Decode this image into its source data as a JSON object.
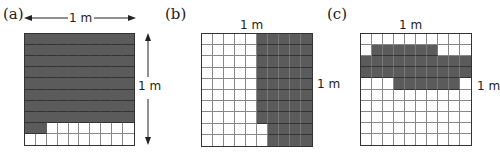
{
  "figure": {
    "colors": {
      "shaded": "#5b5b5b",
      "unshaded": "#ffffff",
      "grid_line": "#888888",
      "outline": "#333333"
    },
    "panels": [
      {
        "id": "a",
        "label": "(a)",
        "width_label": "1 m",
        "height_label": "1 m",
        "has_dimension_arrows": true,
        "grid_size": [
          10,
          10
        ],
        "shaded_count": 82,
        "shaded_rows": [
          [
            1,
            2,
            3,
            4,
            5,
            6,
            7,
            8,
            9,
            10
          ],
          [
            1,
            2,
            3,
            4,
            5,
            6,
            7,
            8,
            9,
            10
          ],
          [
            1,
            2,
            3,
            4,
            5,
            6,
            7,
            8,
            9,
            10
          ],
          [
            1,
            2,
            3,
            4,
            5,
            6,
            7,
            8,
            9,
            10
          ],
          [
            1,
            2,
            3,
            4,
            5,
            6,
            7,
            8,
            9,
            10
          ],
          [
            1,
            2,
            3,
            4,
            5,
            6,
            7,
            8,
            9,
            10
          ],
          [
            1,
            2,
            3,
            4,
            5,
            6,
            7,
            8,
            9,
            10
          ],
          [
            1,
            2,
            3,
            4,
            5,
            6,
            7,
            8,
            9,
            10
          ],
          [
            1,
            2
          ],
          []
        ]
      },
      {
        "id": "b",
        "label": "(b)",
        "width_label": "1 m",
        "height_label": "1 m",
        "has_dimension_arrows": false,
        "grid_size": [
          10,
          10
        ],
        "shaded_count": 48,
        "shaded_rows": [
          [
            6,
            7,
            8,
            9,
            10
          ],
          [
            6,
            7,
            8,
            9,
            10
          ],
          [
            6,
            7,
            8,
            9,
            10
          ],
          [
            6,
            7,
            8,
            9,
            10
          ],
          [
            6,
            7,
            8,
            9,
            10
          ],
          [
            6,
            7,
            8,
            9,
            10
          ],
          [
            6,
            7,
            8,
            9,
            10
          ],
          [
            6,
            7,
            8,
            9,
            10
          ],
          [
            7,
            8,
            9,
            10
          ],
          [
            7,
            8,
            9,
            10
          ]
        ]
      },
      {
        "id": "c",
        "label": "(c)",
        "width_label": "1 m",
        "height_label": "1 m",
        "has_dimension_arrows": false,
        "grid_size": [
          10,
          10
        ],
        "shaded_count": 32,
        "shaded_rows": [
          [],
          [
            2,
            3,
            4,
            5,
            6,
            7
          ],
          [
            1,
            2,
            3,
            4,
            5,
            6,
            7,
            8,
            9,
            10
          ],
          [
            1,
            2,
            3,
            4,
            5,
            6,
            7,
            8,
            9,
            10
          ],
          [
            4,
            5,
            6,
            7,
            8,
            9
          ],
          [],
          [],
          [],
          [],
          []
        ]
      }
    ]
  }
}
